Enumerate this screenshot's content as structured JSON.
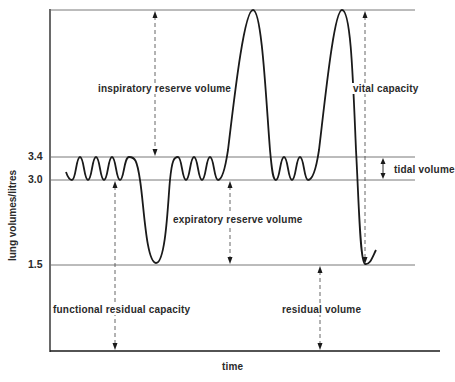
{
  "figure": {
    "y_axis_label": "lung volumes/litres",
    "x_axis_label": "time",
    "ticks": [
      {
        "value": "3.4",
        "y": 157
      },
      {
        "value": "3.0",
        "y": 180
      },
      {
        "value": "1.5",
        "y": 265
      }
    ],
    "annotations": {
      "irv": "inspiratory reserve volume",
      "vc": "vital capacity",
      "tv": "tidal volume",
      "erv": "expiratory reserve volume",
      "frc": "functional residual capacity",
      "rv": "residual volume"
    },
    "colors": {
      "line": "#1a1a1a",
      "grid": "#6a6a6a",
      "arrow": "#555555"
    }
  }
}
